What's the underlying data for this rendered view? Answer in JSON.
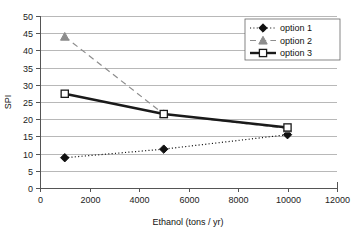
{
  "chart_data": {
    "type": "line",
    "title": "",
    "xlabel": "Ethanol (tons / yr)",
    "ylabel": "SPI",
    "xlim": [
      0,
      12000
    ],
    "ylim": [
      0,
      50
    ],
    "xticks": [
      "0",
      "2000",
      "4000",
      "6000",
      "8000",
      "10000",
      "12000"
    ],
    "xtick_values": [
      0,
      2000,
      4000,
      6000,
      8000,
      10000,
      12000
    ],
    "yticks": [
      "0",
      "5",
      "10",
      "15",
      "20",
      "25",
      "30",
      "35",
      "40",
      "45",
      "50"
    ],
    "ytick_values": [
      0,
      5,
      10,
      15,
      20,
      25,
      30,
      35,
      40,
      45,
      50
    ],
    "grid": "horizontal",
    "legend_position": "top-right",
    "x": [
      1000,
      5000,
      10000
    ],
    "series": [
      {
        "name": "option 1",
        "values": [
          8.8,
          11.3,
          15.5
        ],
        "marker": "filled-diamond",
        "line_style": "dotted",
        "color": "#111111",
        "line_width": 1.2
      },
      {
        "name": "option 2",
        "values": [
          44.0,
          21.5,
          17.3
        ],
        "marker": "filled-triangle",
        "line_style": "dashed",
        "color": "#8d8d8d",
        "line_width": 1.2
      },
      {
        "name": "option 3",
        "values": [
          27.4,
          21.5,
          17.6
        ],
        "marker": "open-square",
        "line_style": "solid",
        "color": "#1a1a1a",
        "line_width": 2.4
      }
    ]
  },
  "legend": {
    "entries": [
      {
        "label": "option 1"
      },
      {
        "label": "option 2"
      },
      {
        "label": "option 3"
      }
    ]
  },
  "axes": {
    "x_title": "Ethanol (tons / yr)",
    "y_title": "SPI"
  }
}
